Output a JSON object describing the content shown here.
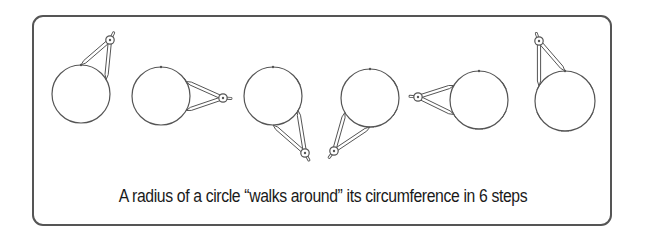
{
  "caption": "A radius  of a circle “walks around” its circumference in 6 steps",
  "colors": {
    "stroke": "#555555",
    "frame": "#555555",
    "text": "#1a1a1a"
  },
  "steps": [
    {
      "step": 1,
      "cx": 81,
      "cy": 94,
      "r": 29,
      "legs_from_deg": 0,
      "legs_to_deg": 60,
      "pivot": [
        110,
        40
      ],
      "ticks_deg": []
    },
    {
      "step": 2,
      "cx": 161,
      "cy": 96,
      "r": 29,
      "legs_from_deg": 60,
      "legs_to_deg": 120,
      "pivot": [
        223,
        98
      ],
      "ticks_deg": [
        60
      ]
    },
    {
      "step": 3,
      "cx": 273,
      "cy": 96,
      "r": 29,
      "legs_from_deg": 120,
      "legs_to_deg": 180,
      "pivot": [
        305,
        153
      ],
      "ticks_deg": [
        60,
        120
      ]
    },
    {
      "step": 4,
      "cx": 370,
      "cy": 98,
      "r": 29,
      "legs_from_deg": 180,
      "legs_to_deg": 240,
      "pivot": [
        334,
        151
      ],
      "ticks_deg": [
        60,
        120,
        180
      ]
    },
    {
      "step": 5,
      "cx": 479,
      "cy": 100,
      "r": 29,
      "legs_from_deg": 240,
      "legs_to_deg": 300,
      "pivot": [
        418,
        97
      ],
      "ticks_deg": [
        60,
        120,
        180,
        240
      ]
    },
    {
      "step": 6,
      "cx": 565,
      "cy": 101,
      "r": 30,
      "legs_from_deg": 300,
      "legs_to_deg": 360,
      "pivot": [
        539,
        41
      ],
      "ticks_deg": [
        60,
        120,
        180,
        240,
        300
      ]
    }
  ]
}
